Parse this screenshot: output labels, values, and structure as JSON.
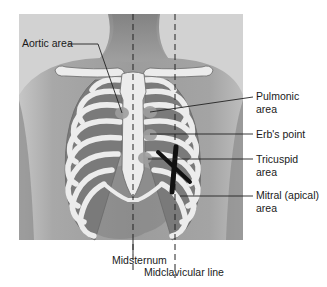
{
  "figure": {
    "labels": {
      "aortic": "Aortic area",
      "pulmonic_line1": "Pulmonic",
      "pulmonic_line2": "area",
      "erbs": "Erb's point",
      "tricuspid_line1": "Tricuspid",
      "tricuspid_line2": "area",
      "mitral_line1": "Mitral (apical)",
      "mitral_line2": "area",
      "midsternum": "Midsternum",
      "midclavicular": "Midclavicular line"
    },
    "colors": {
      "photo_bg": "#9a9a9a",
      "skin_light": "#b8b8b8",
      "bone": "#ececec",
      "bone_outline": "#6a6a6a",
      "intercostal": "#7a7a7a",
      "heart_mark": "#111111",
      "leader_line": "#222222"
    }
  }
}
